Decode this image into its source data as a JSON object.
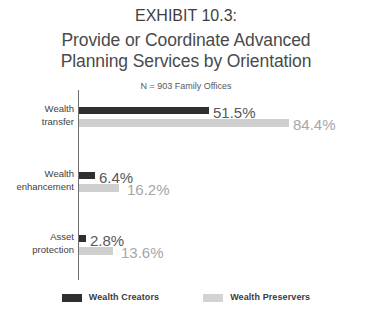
{
  "header": {
    "exhibit_label": "EXHIBIT 10.3:",
    "title_line_1": "Provide or Coordinate Advanced",
    "title_line_2": "Planning Services by Orientation",
    "subtitle": "N = 903 Family Offices"
  },
  "legend": {
    "items": [
      {
        "label": "Wealth Creators",
        "color": "#2f2f31",
        "swatch_name": "legend-swatch-creators"
      },
      {
        "label": "Wealth Preservers",
        "color": "#d3d3d3",
        "swatch_name": "legend-swatch-preservers"
      }
    ]
  },
  "categories_display": [
    {
      "line_1": "Wealth",
      "line_2": "transfer"
    },
    {
      "line_1": "Wealth",
      "line_2": "enhancement"
    },
    {
      "line_1": "Asset",
      "line_2": "protection"
    }
  ],
  "value_labels": {
    "g0_creators": "51.5%",
    "g0_preservers": "84.4%",
    "g1_creators": "6.4%",
    "g1_preservers": "16.2%",
    "g2_creators": "2.8%",
    "g2_preservers": "13.6%"
  },
  "chart_data": {
    "type": "bar",
    "orientation": "horizontal",
    "title": "Provide or Coordinate Advanced Planning Services by Orientation",
    "subtitle": "N = 903 Family Offices",
    "exhibit": "EXHIBIT 10.3:",
    "xlabel": "",
    "ylabel": "",
    "xlim": [
      0,
      100
    ],
    "unit": "percent",
    "grid": false,
    "legend_position": "bottom-center",
    "categories": [
      "Wealth transfer",
      "Wealth enhancement",
      "Asset protection"
    ],
    "series": [
      {
        "name": "Wealth Creators",
        "color": "#2f2f31",
        "values": [
          51.5,
          16.2,
          2.8
        ]
      },
      {
        "name": "Wealth Preservers",
        "color": "#d3d3d3",
        "values": [
          84.4,
          16.2,
          13.6
        ]
      }
    ],
    "data_labels": [
      [
        "51.5%",
        "84.4%"
      ],
      [
        "6.4%",
        "16.2%"
      ],
      [
        "2.8%",
        "13.6%"
      ]
    ]
  },
  "bar_geometry": {
    "g0_creators_w": "130px",
    "g0_preservers_w": "210px",
    "g1_creators_w": "16px",
    "g1_preservers_w": "40px",
    "g2_creators_w": "7px",
    "g2_preservers_w": "34px",
    "g0_creators_label_x": "134px",
    "g0_preservers_label_x": "214px",
    "g1_creators_label_x": "20px",
    "g1_preservers_label_x": "48px",
    "g2_creators_label_x": "11px",
    "g2_preservers_label_x": "42px"
  }
}
